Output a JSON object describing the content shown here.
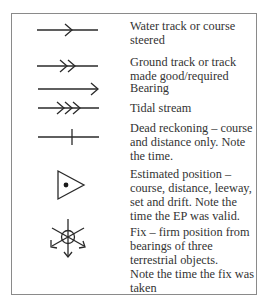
{
  "entries": [
    {
      "symbol": "single-chevron-arrow-line",
      "label": "Water track or course steered"
    },
    {
      "symbol": "double-chevron-arrow-line",
      "label": "Ground track or track made good/required"
    },
    {
      "symbol": "arrowhead-line",
      "label": "Bearing"
    },
    {
      "symbol": "triple-chevron-arrow-line",
      "label": "Tidal stream"
    },
    {
      "symbol": "line-with-tick",
      "label": "Dead reckoning – course and distance only. Note the time."
    },
    {
      "symbol": "triangle-with-dot",
      "label": "Estimated position – course, distance, leeway, set and drift. Note the time the EP was valid."
    },
    {
      "symbol": "circled-fix-with-three-bearings",
      "label": "Fix – firm position from bearings of three terrestrial objects."
    },
    {
      "symbol": "none",
      "label": "Note the time the fix was taken"
    }
  ],
  "colors": {
    "frame": "#8a8a8a",
    "ink": "#2a2a2a",
    "background": "#ffffff"
  }
}
